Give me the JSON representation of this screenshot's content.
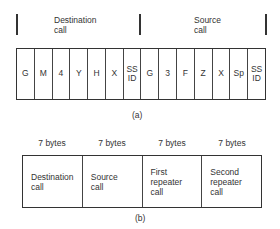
{
  "part_a": {
    "groups": [
      {
        "label": "Destination\ncall"
      },
      {
        "label": "Source\ncall"
      }
    ],
    "cells": [
      "G",
      "M",
      "4",
      "Y",
      "H",
      "X",
      "SS\nID",
      "G",
      "3",
      "F",
      "Z",
      "X",
      "Sp",
      "SS\nID"
    ],
    "caption": "(a)"
  },
  "part_b": {
    "fields": [
      {
        "size": "7 bytes",
        "label": "Destination\ncall"
      },
      {
        "size": "7 bytes",
        "label": "Source\ncall"
      },
      {
        "size": "7 bytes",
        "label": "First\nrepeater\ncall"
      },
      {
        "size": "7 bytes",
        "label": "Second\nrepeater\ncall"
      }
    ],
    "caption": "(b)"
  }
}
